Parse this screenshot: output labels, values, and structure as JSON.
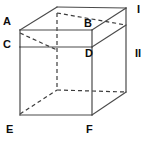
{
  "figure": {
    "type": "geometry-diagram",
    "background_color": "#ffffff",
    "solid_line_color": "#4a4a4a",
    "hidden_line_color": "#3c3c3c",
    "label_color": "#0d0d0d",
    "solid_line_width": 1.2,
    "hidden_line_width": 1.2,
    "hidden_line_dash": "4,3"
  },
  "labels": {
    "A": "A",
    "B": "B",
    "C": "C",
    "D": "D",
    "E": "E",
    "F": "F",
    "region_one": "I",
    "region_two": "II"
  },
  "label_positions": {
    "A": {
      "x": 3,
      "y": 16
    },
    "B": {
      "x": 84,
      "y": 18
    },
    "C": {
      "x": 3,
      "y": 39
    },
    "D": {
      "x": 85,
      "y": 48
    },
    "E": {
      "x": 6,
      "y": 124
    },
    "F": {
      "x": 86,
      "y": 124
    },
    "I": {
      "x": 137,
      "y": 4
    },
    "II": {
      "x": 135,
      "y": 48
    }
  },
  "vertices": {
    "A": {
      "x": 20,
      "y": 30
    },
    "B": {
      "x": 92,
      "y": 30
    },
    "C": {
      "x": 20,
      "y": 47
    },
    "D": {
      "x": 92,
      "y": 47
    },
    "E": {
      "x": 20,
      "y": 115
    },
    "F": {
      "x": 92,
      "y": 115
    },
    "top_back_left": {
      "x": 57,
      "y": 13
    },
    "top_back_right": {
      "x": 126,
      "y": 8
    },
    "right_upper": {
      "x": 126,
      "y": 25
    },
    "right_mid": {
      "x": 126,
      "y": 42
    },
    "right_lower": {
      "x": 126,
      "y": 92
    },
    "hidden_back_bottom": {
      "x": 57,
      "y": 90
    }
  },
  "edges": {
    "solid": [
      {
        "name": "edge-A-B",
        "from": "A",
        "to": "B"
      },
      {
        "name": "edge-C-D",
        "from": "C",
        "to": "D"
      },
      {
        "name": "edge-A-C",
        "from": "A",
        "to": "C"
      },
      {
        "name": "edge-B-D",
        "from": "B",
        "to": "D"
      },
      {
        "name": "edge-C-E",
        "from": "C",
        "to": "E"
      },
      {
        "name": "edge-D-F",
        "from": "D",
        "to": "F"
      },
      {
        "name": "edge-E-F",
        "from": "E",
        "to": "F"
      },
      {
        "name": "edge-A-topbackleft",
        "from": "A",
        "to": "top_back_left"
      },
      {
        "name": "edge-topbackleft-topbackright",
        "from": "top_back_left",
        "to": "top_back_right"
      },
      {
        "name": "edge-B-topbackright",
        "from": "B",
        "to": "top_back_right"
      },
      {
        "name": "edge-topbackright-rightlower",
        "from": "top_back_right",
        "to": "right_lower"
      },
      {
        "name": "edge-D-rightmid",
        "from": "D",
        "to": "right_mid"
      },
      {
        "name": "edge-F-rightlower",
        "from": "F",
        "to": "right_lower"
      }
    ],
    "hidden": [
      {
        "name": "hidden-A-backbottom-diagonal",
        "from": "A",
        "to": "hidden_back_bottom"
      },
      {
        "name": "hidden-E-backbottom-diagonal",
        "from": "E",
        "to": "hidden_back_bottom"
      },
      {
        "name": "hidden-back-vertical",
        "from": "top_back_left",
        "to": "hidden_back_bottom"
      },
      {
        "name": "hidden-back-top-horizontal",
        "from": "top_back_left",
        "to": "right_upper"
      },
      {
        "name": "hidden-back-bottom-horizontal",
        "from": "hidden_back_bottom",
        "to": "right_lower"
      }
    ]
  }
}
